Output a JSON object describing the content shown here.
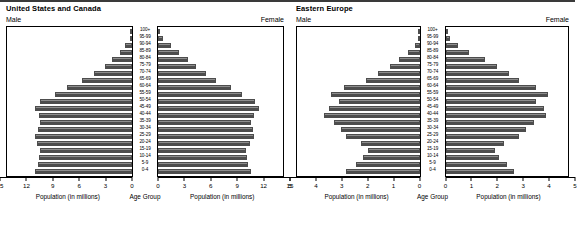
{
  "panels": [
    {
      "title": "United States and Canada",
      "male_label": "Male",
      "female_label": "Female",
      "age_group_label": "Age Group",
      "male_caption": "Population (in millions)",
      "female_caption": "Population (in millions)"
    },
    {
      "title": "Eastern Europe",
      "male_label": "Male",
      "female_label": "Female",
      "age_group_label": "Age Group",
      "male_caption": "Population (in millions)",
      "female_caption": "Population (in millions)"
    }
  ],
  "chart_data": [
    {
      "type": "bar",
      "title": "United States and Canada",
      "subtype": "population-pyramid",
      "xlabel": "Population (in millions)",
      "ylabel": "Age Group",
      "xlim": [
        0,
        15
      ],
      "xticks": [
        0,
        3,
        6,
        9,
        12,
        15
      ],
      "male_xticks_left_to_right": [
        15,
        12,
        9,
        6,
        3,
        0
      ],
      "female_xticks_left_to_right": [
        0,
        3,
        6,
        9,
        12,
        15
      ],
      "grid": false,
      "legend": [
        "Male",
        "Female"
      ],
      "legend_position": "top-outside",
      "categories": [
        "100+",
        "95-99",
        "90-94",
        "85-89",
        "80-84",
        "75-79",
        "70-74",
        "65-69",
        "60-64",
        "55-59",
        "50-54",
        "45-49",
        "40-44",
        "35-39",
        "30-34",
        "25-29",
        "20-24",
        "15-19",
        "10-14",
        "5-9",
        "0-4"
      ],
      "series": [
        {
          "name": "Male",
          "values": [
            0.1,
            0.3,
            0.8,
            1.5,
            2.4,
            3.3,
            4.6,
            6.0,
            7.8,
            9.3,
            11.0,
            11.7,
            11.2,
            11.0,
            11.3,
            11.6,
            11.4,
            11.1,
            11.2,
            11.3,
            11.6
          ]
        },
        {
          "name": "Female",
          "values": [
            0.2,
            0.6,
            1.5,
            2.5,
            3.6,
            4.5,
            5.7,
            7.0,
            8.7,
            10.1,
            11.6,
            12.1,
            11.5,
            11.2,
            11.4,
            11.5,
            11.0,
            10.6,
            10.7,
            10.8,
            11.1
          ]
        }
      ]
    },
    {
      "type": "bar",
      "title": "Eastern Europe",
      "subtype": "population-pyramid",
      "xlabel": "Population (in millions)",
      "ylabel": "Age Group",
      "xlim": [
        0,
        5
      ],
      "xticks": [
        0,
        1,
        2,
        3,
        4,
        5
      ],
      "male_xticks_left_to_right": [
        5,
        4,
        3,
        2,
        1,
        0
      ],
      "female_xticks_left_to_right": [
        0,
        1,
        2,
        3,
        4,
        5
      ],
      "grid": false,
      "legend": [
        "Male",
        "Female"
      ],
      "legend_position": "top-outside",
      "categories": [
        "100+",
        "95-99",
        "90-94",
        "85-89",
        "80-84",
        "75-79",
        "70-74",
        "65-69",
        "60-64",
        "55-59",
        "50-54",
        "45-49",
        "40-44",
        "35-39",
        "30-34",
        "25-29",
        "20-24",
        "15-19",
        "10-14",
        "5-9",
        "0-4"
      ],
      "series": [
        {
          "name": "Male",
          "values": [
            0.02,
            0.08,
            0.2,
            0.45,
            0.85,
            1.2,
            1.7,
            2.2,
            3.1,
            3.6,
            3.3,
            3.7,
            3.9,
            3.5,
            3.2,
            3.0,
            2.4,
            2.1,
            2.3,
            2.6,
            3.0
          ]
        },
        {
          "name": "Female",
          "values": [
            0.05,
            0.2,
            0.5,
            0.95,
            1.6,
            2.1,
            2.6,
            3.0,
            3.7,
            4.2,
            3.7,
            4.0,
            4.1,
            3.6,
            3.3,
            3.0,
            2.4,
            2.0,
            2.2,
            2.5,
            2.8
          ]
        }
      ]
    }
  ],
  "colors": {
    "bar_dark": "#8e8e8e",
    "bar_light": "#c4c4c4",
    "bar_outline": "#4d4d4d",
    "axis": "#000000"
  }
}
